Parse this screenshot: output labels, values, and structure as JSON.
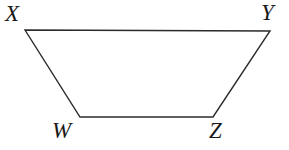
{
  "figure": {
    "name": "trapezoid-XYZW",
    "shape_type": "trapezoid",
    "background_color": "#ffffff",
    "stroke_color": "#2b2b2b",
    "stroke_width": 1.4,
    "fill": "none",
    "vertices": [
      {
        "id": "X",
        "label": "X",
        "x": 25,
        "y": 30,
        "label_x": 5,
        "label_y": 2,
        "position": "top-left"
      },
      {
        "id": "Y",
        "label": "Y",
        "x": 270,
        "y": 31,
        "label_x": 261,
        "label_y": 1,
        "position": "top-right"
      },
      {
        "id": "Z",
        "label": "Z",
        "x": 213,
        "y": 117,
        "label_x": 209,
        "label_y": 119,
        "position": "bottom-right"
      },
      {
        "id": "W",
        "label": "W",
        "x": 80,
        "y": 117,
        "label_x": 52,
        "label_y": 119,
        "position": "bottom-left"
      }
    ],
    "edges": [
      {
        "id": "XY",
        "from": "X",
        "to": "Y",
        "name": "top-side"
      },
      {
        "id": "YZ",
        "from": "Y",
        "to": "Z",
        "name": "right-side"
      },
      {
        "id": "ZW",
        "from": "Z",
        "to": "W",
        "name": "bottom-side"
      },
      {
        "id": "WX",
        "from": "W",
        "to": "X",
        "name": "left-side"
      }
    ],
    "path": "M 25 30 L 270 31 L 213 117 L 80 117 Z",
    "labels": {
      "X": "X",
      "Y": "Y",
      "W": "W",
      "Z": "Z"
    }
  }
}
